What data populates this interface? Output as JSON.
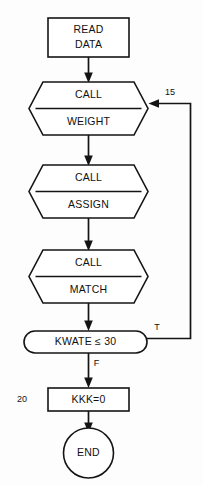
{
  "diagram": {
    "type": "flowchart",
    "colors": {
      "stroke": "#141414",
      "fill": "#ffffff",
      "background": "#fdfdfd",
      "text": "#111111"
    },
    "nodes": [
      {
        "id": "read-data",
        "shape": "rectangle",
        "line1": "READ",
        "line2": "DATA"
      },
      {
        "id": "call-weight",
        "shape": "hexagon-split",
        "line1": "CALL",
        "line2": "WEIGHT"
      },
      {
        "id": "call-assign",
        "shape": "hexagon-split",
        "line1": "CALL",
        "line2": "ASSIGN"
      },
      {
        "id": "call-match",
        "shape": "hexagon-split",
        "line1": "CALL",
        "line2": "MATCH"
      },
      {
        "id": "decision-kwate",
        "shape": "stadium",
        "line1": "KWATE ≤ 30"
      },
      {
        "id": "assign-kkk",
        "shape": "rectangle",
        "line1": "KKK=0"
      },
      {
        "id": "end",
        "shape": "circle",
        "line1": "END"
      }
    ],
    "edge_labels": {
      "loop_back": "15",
      "decision_true": "T",
      "decision_false": "F"
    },
    "step_labels": {
      "kkk_step": "20"
    }
  }
}
